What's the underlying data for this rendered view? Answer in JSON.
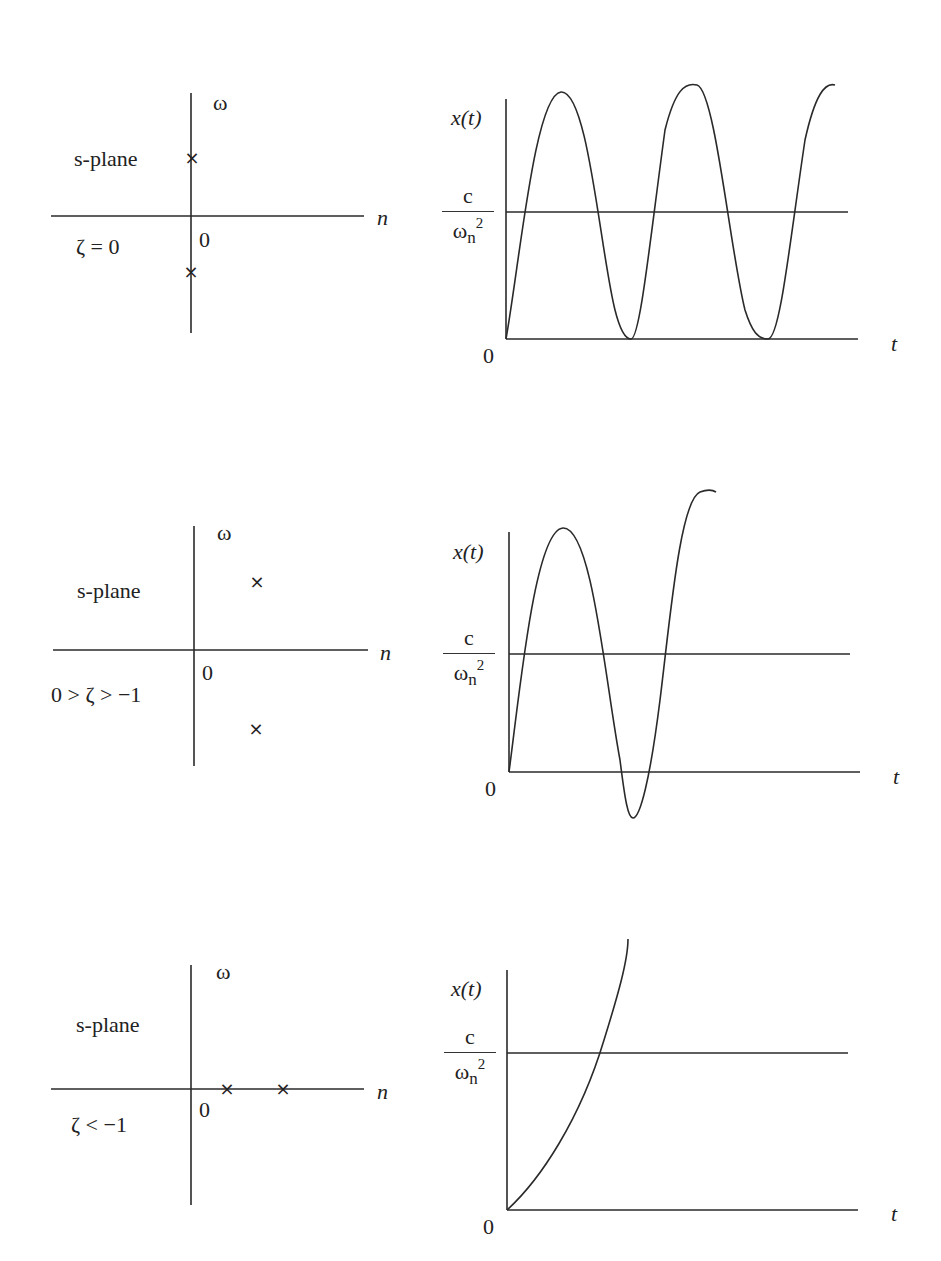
{
  "panels": [
    {
      "id": "undamped",
      "splane": {
        "title": "s-plane",
        "condition": "ζ = 0",
        "imag_axis_label": "ω",
        "real_axis_label": "n",
        "origin_label": "0",
        "pole_symbol": "×",
        "poles": [
          {
            "re": 0,
            "im": 1
          },
          {
            "re": 0,
            "im": -1
          }
        ]
      },
      "response": {
        "y_label": "x(t)",
        "ref_num": "c",
        "ref_den": "ω",
        "ref_den_sub": "n",
        "ref_den_sup": "2",
        "origin_label": "0",
        "x_label": "t",
        "behavior": "sustained oscillation between 0 and 2c/ωn²"
      }
    },
    {
      "id": "negatively-damped",
      "splane": {
        "title": "s-plane",
        "condition": "0 > ζ > −1",
        "imag_axis_label": "ω",
        "real_axis_label": "n",
        "origin_label": "0",
        "pole_symbol": "×",
        "poles": [
          {
            "re": 0.4,
            "im": 1
          },
          {
            "re": 0.4,
            "im": -1
          }
        ]
      },
      "response": {
        "y_label": "x(t)",
        "ref_num": "c",
        "ref_den": "ω",
        "ref_den_sub": "n",
        "ref_den_sup": "2",
        "origin_label": "0",
        "x_label": "t",
        "behavior": "growing oscillation"
      }
    },
    {
      "id": "overdamped-unstable",
      "splane": {
        "title": "s-plane",
        "condition": "ζ < −1",
        "imag_axis_label": "ω",
        "real_axis_label": "n",
        "origin_label": "0",
        "pole_symbol": "×",
        "poles": [
          {
            "re": 0.35,
            "im": 0
          },
          {
            "re": 0.9,
            "im": 0
          }
        ]
      },
      "response": {
        "y_label": "x(t)",
        "ref_num": "c",
        "ref_den": "ω",
        "ref_den_sub": "n",
        "ref_den_sup": "2",
        "origin_label": "0",
        "x_label": "t",
        "behavior": "non-oscillatory exponential growth"
      }
    }
  ],
  "colors": {
    "ink": "#222222",
    "background": "#ffffff"
  }
}
